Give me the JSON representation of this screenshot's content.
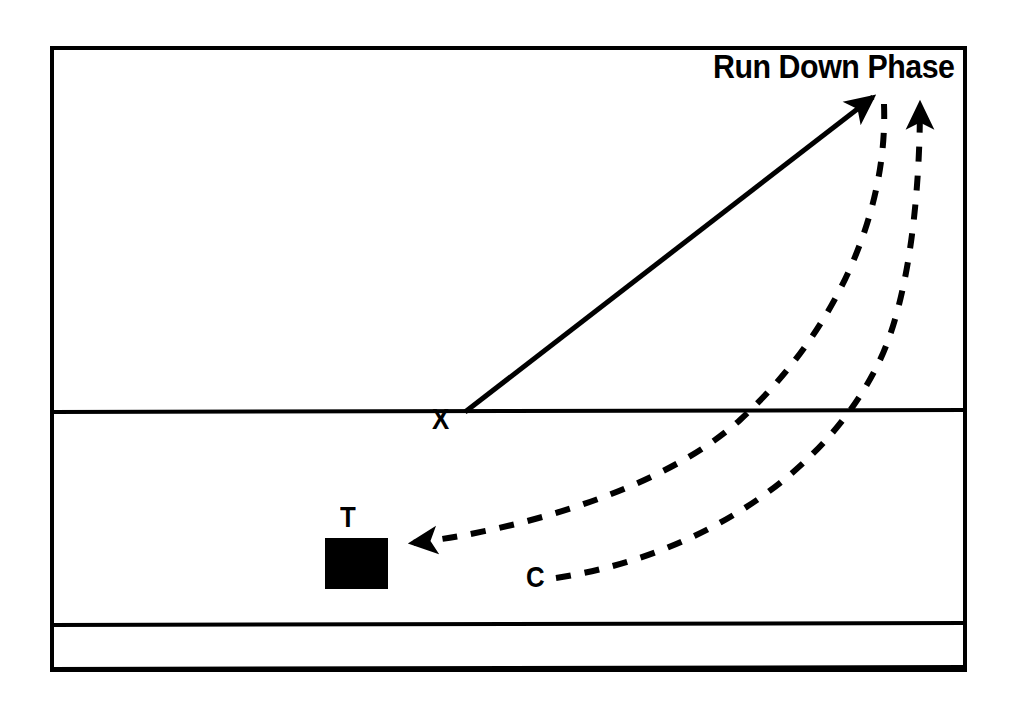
{
  "diagram": {
    "title": "Run Down Phase",
    "type": "football-play-diagram",
    "background_color": "#ffffff",
    "ink_color": "#000000",
    "frame": {
      "name": "field-boundary",
      "x": 52,
      "y": 48,
      "width": 913,
      "height": 622,
      "stroke_width": 4
    },
    "yard_lines": [
      {
        "name": "line-of-scrimmage",
        "y": 412,
        "stroke_width": 4
      },
      {
        "name": "yard-line-lower",
        "y": 625,
        "stroke_width": 4
      },
      {
        "name": "yard-line-bottom",
        "y": 668,
        "stroke_width": 4
      }
    ],
    "labels": [
      {
        "id": "x",
        "text": "X",
        "x": 432,
        "y": 404,
        "role": "receiver-position"
      },
      {
        "id": "t",
        "text": "T",
        "x": 340,
        "y": 502,
        "role": "tackle-position"
      },
      {
        "id": "c",
        "text": "C",
        "x": 526,
        "y": 562,
        "role": "corner-position"
      }
    ],
    "player_marker": {
      "name": "tackle-block-marker",
      "shape": "filled-rectangle",
      "x": 325,
      "y": 538,
      "width": 63,
      "height": 51,
      "fill": "#000000"
    },
    "routes": [
      {
        "id": "x-release-route",
        "name": "solid-route-x-vertical",
        "style": "solid",
        "stroke_width": 5,
        "from": {
          "x": 465,
          "y": 412
        },
        "to": {
          "x": 880,
          "y": 92
        },
        "arrowhead": "at-end"
      },
      {
        "id": "inner-dashed-route",
        "name": "dashed-route-to-target",
        "style": "dashed",
        "stroke_width": 6,
        "dash": "15 14",
        "from": {
          "x": 880,
          "y": 92
        },
        "to": {
          "x": 399,
          "y": 544
        },
        "arrowhead": "at-end",
        "curve": "bows-right"
      },
      {
        "id": "outer-dashed-route",
        "name": "dashed-route-c-upfield",
        "style": "dashed",
        "stroke_width": 6,
        "dash": "15 14",
        "from": {
          "x": 556,
          "y": 578
        },
        "to": {
          "x": 920,
          "y": 88
        },
        "arrowhead": "at-end",
        "curve": "bows-right"
      }
    ]
  }
}
